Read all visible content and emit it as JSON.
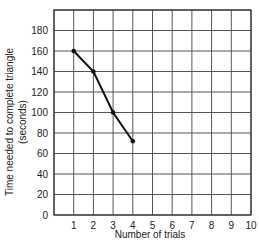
{
  "chart_data": {
    "type": "line",
    "title": "",
    "xlabel": "Number of trials",
    "ylabel": "Time needed to complete triangle",
    "ylabel_line2": "(seconds)",
    "x": [
      1,
      2,
      3,
      4
    ],
    "series": [
      {
        "name": "Time needed",
        "values": [
          160,
          140,
          100,
          72
        ]
      }
    ],
    "xlim": [
      0,
      10
    ],
    "ylim": [
      0,
      200
    ],
    "x_ticks": [
      "1",
      "2",
      "3",
      "4",
      "5",
      "6",
      "7",
      "8",
      "9",
      "10"
    ],
    "y_ticks": [
      "0",
      "20",
      "40",
      "60",
      "80",
      "100",
      "120",
      "140",
      "160",
      "180"
    ],
    "grid": true,
    "legend": "none"
  },
  "colors": {
    "line": "#111111",
    "grid": "#555555",
    "text": "#222222"
  }
}
